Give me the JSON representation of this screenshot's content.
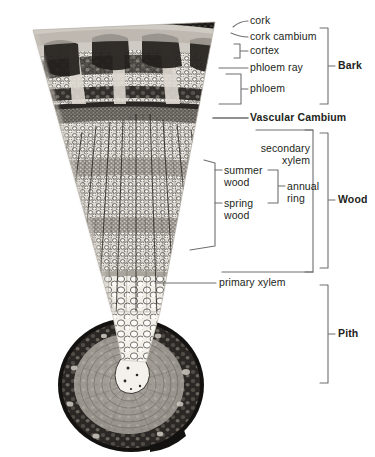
{
  "figure": {
    "colors": {
      "leader_line": "#6d6e71",
      "text": "#231f20",
      "background": "#ffffff",
      "tissue_dark": "#1c1a18",
      "tissue_mid": "#8b8680",
      "tissue_light": "#e8e4dd"
    }
  },
  "labels": {
    "cork": "cork",
    "cork_cambium": "cork cambium",
    "cortex": "cortex",
    "phloem_ray": "phloem ray",
    "phloem": "phloem",
    "vascular_cambium": "Vascular Cambium",
    "secondary_xylem_l1": "secondary",
    "secondary_xylem_l2": "xylem",
    "summer_wood_l1": "summer",
    "summer_wood_l2": "wood",
    "spring_wood_l1": "spring",
    "spring_wood_l2": "wood",
    "annual_ring_l1": "annual",
    "annual_ring_l2": "ring",
    "primary_xylem": "primary xylem"
  },
  "regions": {
    "bark": "Bark",
    "wood": "Wood",
    "pith": "Pith"
  }
}
